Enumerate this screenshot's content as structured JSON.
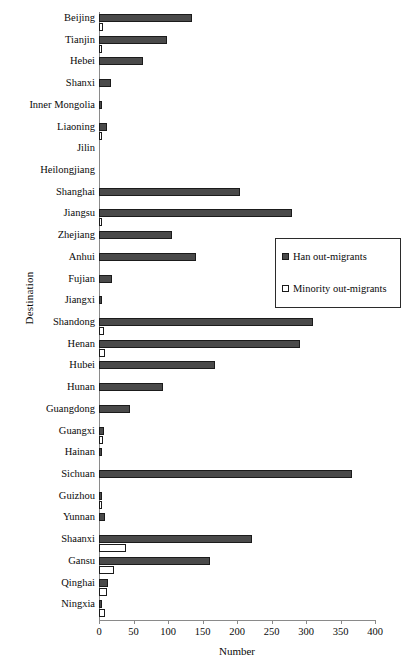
{
  "chart_data": {
    "type": "bar",
    "orientation": "horizontal",
    "title": "",
    "xlabel": "Number",
    "ylabel": "Destination",
    "xlim": [
      0,
      400
    ],
    "xticks": [
      0,
      50,
      100,
      150,
      200,
      250,
      300,
      350,
      400
    ],
    "grid": false,
    "legend_position": "upper-right-inside",
    "categories": [
      "Beijing",
      "Tianjin",
      "Hebei",
      "Shanxi",
      "Inner Mongolia",
      "Liaoning",
      "Jilin",
      "Heilongjiang",
      "Shanghai",
      "Jiangsu",
      "Zhejiang",
      "Anhui",
      "Fujian",
      "Jiangxi",
      "Shandong",
      "Henan",
      "Hubei",
      "Hunan",
      "Guangdong",
      "Guangxi",
      "Hainan",
      "Sichuan",
      "Guizhou",
      "Yunnan",
      "Shaanxi",
      "Gansu",
      "Qinghai",
      "Ningxia"
    ],
    "series": [
      {
        "name": "Han out-migrants",
        "color": "#4a4a4a",
        "values": [
          135,
          99,
          64,
          18,
          4,
          11,
          0,
          0,
          205,
          279,
          106,
          140,
          19,
          4,
          310,
          291,
          168,
          93,
          45,
          7,
          5,
          367,
          4,
          8,
          222,
          161,
          13,
          5
        ]
      },
      {
        "name": "Minority out-migrants",
        "color": "#ffffff",
        "values": [
          6,
          5,
          0,
          0,
          0,
          3,
          0,
          0,
          0,
          4,
          0,
          0,
          0,
          0,
          7,
          8,
          0,
          0,
          0,
          6,
          0,
          0,
          5,
          0,
          39,
          22,
          12,
          8
        ]
      }
    ]
  },
  "legend": {
    "items": [
      {
        "label": "Han out-migrants",
        "swatch": "filled-square-icon"
      },
      {
        "label": "Minority out-migrants",
        "swatch": "open-square-icon"
      }
    ]
  }
}
